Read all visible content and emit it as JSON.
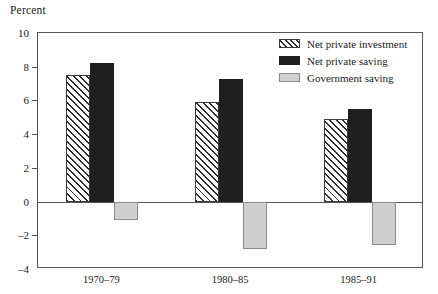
{
  "chart_data": {
    "type": "bar",
    "title": "",
    "subtitle": "",
    "xlabel": "",
    "ylabel": "Percent",
    "ylim": [
      -4,
      10
    ],
    "yticks": [
      10,
      8,
      6,
      4,
      2,
      0,
      -2,
      -4
    ],
    "ytick_labels": [
      "10",
      "8",
      "6",
      "4",
      "2",
      "0",
      "–2",
      "–4"
    ],
    "grid": false,
    "zero_line": true,
    "legend_position": "top-right",
    "categories": [
      "1970–79",
      "1980–85",
      "1985–91"
    ],
    "series": [
      {
        "name": "Net private investment",
        "fill": "hatched",
        "color": "#ffffff",
        "values": [
          7.5,
          5.9,
          4.9
        ]
      },
      {
        "name": "Net private saving",
        "fill": "solid-black",
        "color": "#1f1f1f",
        "values": [
          8.2,
          7.3,
          5.5
        ]
      },
      {
        "name": "Government saving",
        "fill": "light-gray",
        "color": "#cfcfcf",
        "values": [
          -1.1,
          -2.8,
          -2.6
        ]
      }
    ]
  }
}
